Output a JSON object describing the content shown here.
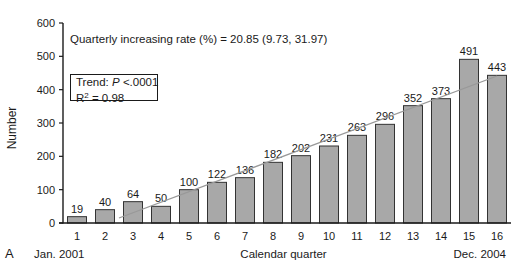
{
  "chart_data": {
    "type": "bar",
    "title": "",
    "panel_label": "A",
    "xlabel": "Calendar quarter",
    "ylabel": "Number",
    "x_start_label": "Jan. 2001",
    "x_end_label": "Dec. 2004",
    "categories": [
      "1",
      "2",
      "3",
      "4",
      "5",
      "6",
      "7",
      "8",
      "9",
      "10",
      "11",
      "12",
      "13",
      "14",
      "15",
      "16"
    ],
    "values": [
      19,
      40,
      64,
      50,
      100,
      122,
      136,
      182,
      202,
      231,
      263,
      296,
      352,
      373,
      491,
      443
    ],
    "ylim": [
      0,
      600
    ],
    "yticks": [
      0,
      100,
      200,
      300,
      400,
      500,
      600
    ],
    "grid": false,
    "bar_color": "#a8a8a8",
    "bar_edge_color": "#333333",
    "trend_line": {
      "from_quarter": 2.5,
      "from_value": 15,
      "to_quarter": 16,
      "to_value": 441,
      "color": "#999999"
    },
    "annotations": {
      "rate": "Quarterly increasing rate (%) = 20.85 (9.73, 31.97)",
      "trend_prefix": "Trend: ",
      "trend_p_symbol": "P",
      "trend_p_value": " <.0001",
      "r2_prefix": "R",
      "r2_sup": "2",
      "r2_value": " = 0.98"
    }
  }
}
